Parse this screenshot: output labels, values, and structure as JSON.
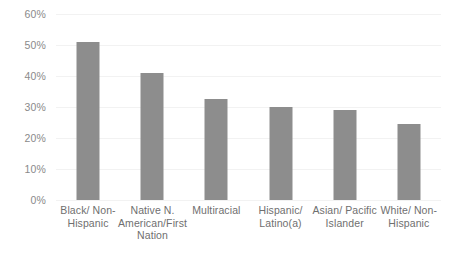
{
  "chart_data": {
    "type": "bar",
    "title": "",
    "subtitle": "",
    "xlabel": "",
    "ylabel": "",
    "legend": [],
    "legend_position": "none",
    "grid": true,
    "ylim": [
      0,
      60
    ],
    "y_tick_labels": [
      "60%",
      "50%",
      "40%",
      "30%",
      "20%",
      "10%",
      "0%"
    ],
    "y_tick_values": [
      60,
      50,
      40,
      30,
      20,
      10,
      0
    ],
    "categories": [
      "Black/ Non-Hispanic",
      "Native N. American/First Nation",
      "Multiracial",
      "Hispanic/ Latino(a)",
      "Asian/ Pacific Islander",
      "White/ Non-Hispanic"
    ],
    "category_lines": [
      [
        "Black/ Non-",
        "Hispanic"
      ],
      [
        "Native N.",
        "American/First",
        "Nation"
      ],
      [
        "Multiracial"
      ],
      [
        "Hispanic/",
        "Latino(a)"
      ],
      [
        "Asian/ Pacific",
        "Islander"
      ],
      [
        "White/ Non-",
        "Hispanic"
      ]
    ],
    "values": [
      51,
      41,
      32.5,
      30,
      29,
      24.5
    ],
    "value_labels": [
      "51%",
      "41%",
      "32.5%",
      "30%",
      "29%",
      "24.5%"
    ],
    "bar_color": "#8d8d8d",
    "grid_color": "#f2f2f2",
    "axis_text_color": "#8a8a8a",
    "category_text_color": "#6f6f6f",
    "background_color": "#ffffff"
  }
}
